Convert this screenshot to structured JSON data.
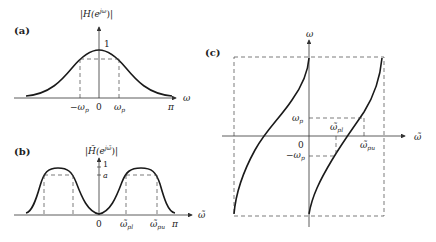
{
  "figure": {
    "panels": {
      "a": {
        "tag": "(a)",
        "ylabel": "|H(e^{jω})|",
        "ylabel_main": "|H(e",
        "ylabel_sup": "jω",
        "ylabel_end": ")|",
        "xlabel": "ω",
        "peak_label": "1",
        "ticks": {
          "neg_wp": "−ω",
          "neg_wp_sub": "p",
          "zero": "0",
          "wp": "ω",
          "wp_sub": "p",
          "pi": "π"
        }
      },
      "b": {
        "tag": "(b)",
        "ylabel_main": "|H̃(e",
        "ylabel_sup": "jω̃",
        "ylabel_end": ")|",
        "xlabel": "ω̃",
        "peak_label": "1",
        "level_label": "a",
        "ticks": {
          "zero": "0",
          "wpl": "ω̃",
          "wpl_sub": "pl",
          "wpu": "ω̃",
          "wpu_sub": "pu",
          "pi": "π"
        }
      },
      "c": {
        "tag": "(c)",
        "ylabel": "ω",
        "xlabel": "ω̃",
        "labels": {
          "wp": "ω",
          "wp_sub": "p",
          "neg_wp": "−ω",
          "neg_wp_sub": "p",
          "zero": "0",
          "wpl": "ω̃",
          "wpl_sub": "pl",
          "wpu": "ω̃",
          "wpu_sub": "pu"
        }
      }
    },
    "colors": {
      "line": "#1a1a1a",
      "axis": "#333333",
      "dash": "#444444"
    }
  }
}
